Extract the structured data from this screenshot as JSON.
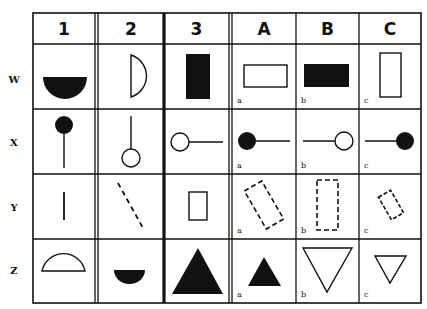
{
  "columns": {
    "left": [
      {
        "label": "1"
      },
      {
        "label": "2"
      },
      {
        "label": "3"
      }
    ],
    "right": [
      {
        "label": "A"
      },
      {
        "label": "B"
      },
      {
        "label": "C"
      }
    ]
  },
  "rows": [
    {
      "label": "W"
    },
    {
      "label": "X"
    },
    {
      "label": "Y"
    },
    {
      "label": "Z"
    }
  ],
  "cell_letters": [
    "a",
    "b",
    "c"
  ],
  "cells": {
    "W": {
      "1": "filled lower semicircle",
      "2": "outline right half-circle",
      "3": "filled tall rectangle",
      "A": "outline wide rectangle",
      "B": "filled wide rectangle",
      "C": "outline tall rectangle"
    },
    "X": {
      "1": "filled circle on top of vertical line",
      "2": "outline circle at bottom of vertical line",
      "3": "outline circle at left of horizontal line",
      "A": "filled circle at left of horizontal line",
      "B": "outline circle at right of horizontal line",
      "C": "filled circle at right of horizontal line"
    },
    "Y": {
      "1": "short solid vertical line",
      "2": "dashed diagonal line",
      "3": "small outline rectangle",
      "A": "dashed tilted rectangle",
      "B": "dashed upright rectangle",
      "C": "small dashed tilted rectangle"
    },
    "Z": {
      "1": "outline upper semicircle",
      "2": "small filled lower semicircle",
      "3": "large filled triangle",
      "A": "small filled triangle",
      "B": "large outline inverted triangle",
      "C": "small outline inverted triangle"
    }
  },
  "colors": {
    "ink": "#111111",
    "background": "#ffffff"
  }
}
